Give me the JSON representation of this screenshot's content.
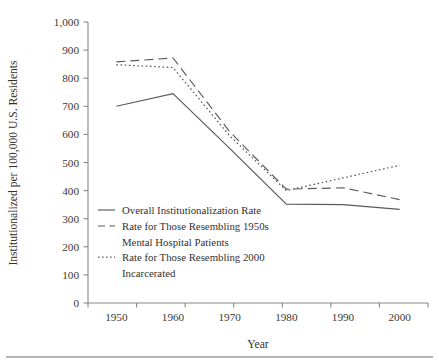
{
  "chart_data": {
    "type": "line",
    "title": "",
    "xlabel": "Year",
    "ylabel": "Institutionalized per 100,000 U.S. Residents",
    "x": [
      1950,
      1960,
      1970,
      1980,
      1990,
      2000
    ],
    "xtick_labels": [
      "1950",
      "1960",
      "1970",
      "1980",
      "1990",
      "2000"
    ],
    "ytick_labels": [
      "0",
      "100",
      "200",
      "300",
      "400",
      "500",
      "600",
      "700",
      "800",
      "900",
      "1,000"
    ],
    "ytick_values": [
      0,
      100,
      200,
      300,
      400,
      500,
      600,
      700,
      800,
      900,
      1000
    ],
    "ylim": [
      0,
      1000
    ],
    "xlim": [
      1945,
      2005
    ],
    "grid": false,
    "legend_position": "inside-lower-left",
    "series": [
      {
        "name": "Overall Institutionalization Rate",
        "style": "solid",
        "color": "#5c5a58",
        "values": [
          700,
          745,
          550,
          352,
          350,
          333
        ]
      },
      {
        "name": "Rate for Those Resembling 1950s Mental Hospital Patients",
        "style": "dashed",
        "color": "#5c5a58",
        "values": [
          858,
          872,
          610,
          405,
          410,
          368
        ]
      },
      {
        "name": "Rate for Those Resembling 2000 Incarcerated",
        "style": "dotted",
        "color": "#5c5a58",
        "values": [
          848,
          838,
          595,
          400,
          445,
          490
        ]
      }
    ]
  },
  "legend": {
    "entries": [
      {
        "line1": "Overall Institutionalization Rate",
        "line2": ""
      },
      {
        "line1": "Rate for Those Resembling 1950s",
        "line2": "Mental Hospital Patients"
      },
      {
        "line1": "Rate for Those Resembling 2000",
        "line2": "Incarcerated"
      }
    ]
  }
}
